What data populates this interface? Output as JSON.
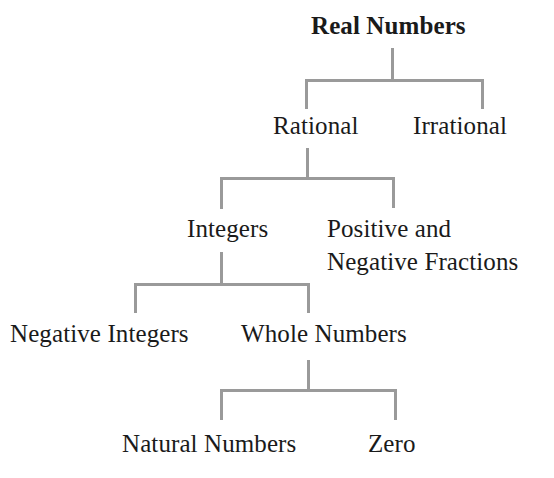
{
  "diagram": {
    "title": "Real Numbers",
    "line_color": "#9a9a9a",
    "nodes": {
      "real": "Real Numbers",
      "rational": "Rational",
      "irrational": "Irrational",
      "integers": "Integers",
      "fractions_line1": "Positive and",
      "fractions_line2": "Negative Fractions",
      "negative_integers": "Negative Integers",
      "whole_numbers": "Whole Numbers",
      "natural_numbers": "Natural Numbers",
      "zero": "Zero"
    },
    "tree": {
      "label": "Real Numbers",
      "children": [
        {
          "label": "Rational",
          "children": [
            {
              "label": "Integers",
              "children": [
                {
                  "label": "Negative Integers"
                },
                {
                  "label": "Whole Numbers",
                  "children": [
                    {
                      "label": "Natural Numbers"
                    },
                    {
                      "label": "Zero"
                    }
                  ]
                }
              ]
            },
            {
              "label": "Positive and Negative Fractions"
            }
          ]
        },
        {
          "label": "Irrational"
        }
      ]
    }
  }
}
